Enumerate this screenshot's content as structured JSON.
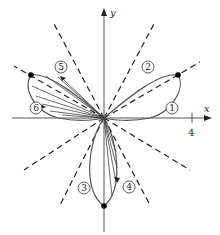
{
  "figure": {
    "type": "polar-rose-diagram",
    "axes": {
      "x_label": "x",
      "y_label": "y",
      "x_tick": "4"
    },
    "petal_labels": [
      "1",
      "2",
      "3",
      "4",
      "5",
      "6"
    ],
    "colors": {
      "ink": "#222222",
      "curve": "#555555",
      "background": "#ffffff"
    }
  }
}
